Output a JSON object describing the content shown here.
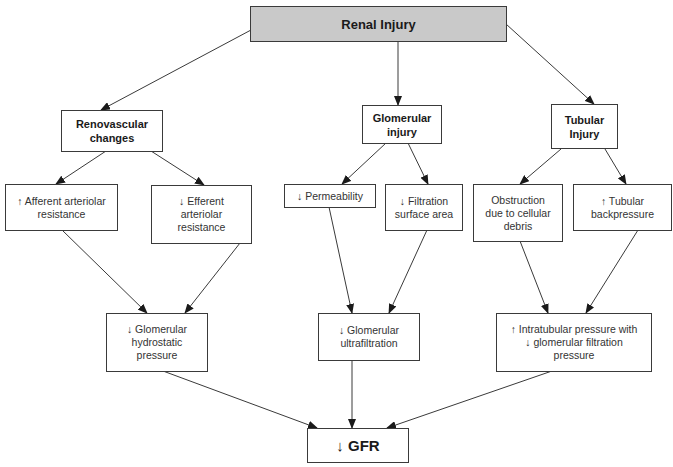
{
  "diagram": {
    "type": "flowchart",
    "title": "Renal Injury",
    "colors": {
      "root_fill": "#c9c9c9",
      "node_fill": "#ffffff",
      "stroke": "#3a3a3a"
    },
    "nodes": {
      "root": {
        "label": "Renal Injury"
      },
      "renovascular": {
        "label": "Renovascular\nchanges"
      },
      "glomerular_injury": {
        "label": "Glomerular\ninjury"
      },
      "tubular_injury": {
        "label": "Tubular\nInjury"
      },
      "afferent": {
        "label": "↑  Afferent arteriolar\nresistance"
      },
      "efferent": {
        "label": "↓  Efferent\narteriolar\nresistance"
      },
      "permeability": {
        "label": "↓  Permeability"
      },
      "filtration_area": {
        "label": "↓  Filtration\nsurface area"
      },
      "obstruction": {
        "label": "Obstruction\ndue to cellular\ndebris"
      },
      "tubular_backpressure": {
        "label": "↑ Tubular\nbackpressure"
      },
      "hydrostatic": {
        "label": "↓ Glomerular\nhydrostatic\npressure"
      },
      "ultrafiltration": {
        "label": "↓ Glomerular\nultrafiltration"
      },
      "intratubular": {
        "label": "↑ Intratubular pressure with\n↓ glomerular filtration\npressure"
      },
      "gfr": {
        "label": "↓ GFR"
      }
    },
    "edges": [
      [
        "root",
        "renovascular"
      ],
      [
        "root",
        "glomerular_injury"
      ],
      [
        "root",
        "tubular_injury"
      ],
      [
        "renovascular",
        "afferent"
      ],
      [
        "renovascular",
        "efferent"
      ],
      [
        "glomerular_injury",
        "permeability"
      ],
      [
        "glomerular_injury",
        "filtration_area"
      ],
      [
        "tubular_injury",
        "obstruction"
      ],
      [
        "tubular_injury",
        "tubular_backpressure"
      ],
      [
        "afferent",
        "hydrostatic"
      ],
      [
        "efferent",
        "hydrostatic"
      ],
      [
        "permeability",
        "ultrafiltration"
      ],
      [
        "filtration_area",
        "ultrafiltration"
      ],
      [
        "obstruction",
        "intratubular"
      ],
      [
        "tubular_backpressure",
        "intratubular"
      ],
      [
        "hydrostatic",
        "gfr"
      ],
      [
        "ultrafiltration",
        "gfr"
      ],
      [
        "intratubular",
        "gfr"
      ]
    ]
  }
}
